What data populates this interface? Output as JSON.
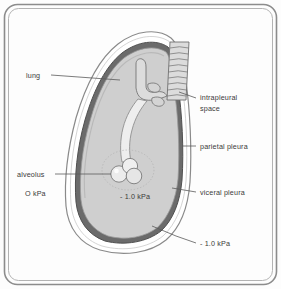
{
  "figure": {
    "background_color": "#fdfdfd",
    "frame_color": "#8c8c8c"
  },
  "colors": {
    "lung_fill": "#cfcfcf",
    "visceral_pleura": "#6b6b6b",
    "parietal_pleura": "#8a8a8a",
    "intrapleural_space": "#ffffff",
    "airway_fill": "#dcdcdc",
    "airway_stroke": "#6f6f6f",
    "alveolus_fill": "#e8e8e8",
    "leader_line": "#5a5a5a",
    "text": "#3a3a3a"
  },
  "labels": {
    "lung": "lung",
    "intrapleural_space_line1": "intrapleural",
    "intrapleural_space_line2": "space",
    "parietal_pleura": "parietal pleura",
    "viceral_pleura": "viceral pleura",
    "alveolus": "alveolus",
    "alveolus_pressure": "O kPa",
    "lung_pressure": "- 1.0 kPa",
    "pleural_pressure": "- 1.0 kPa"
  }
}
